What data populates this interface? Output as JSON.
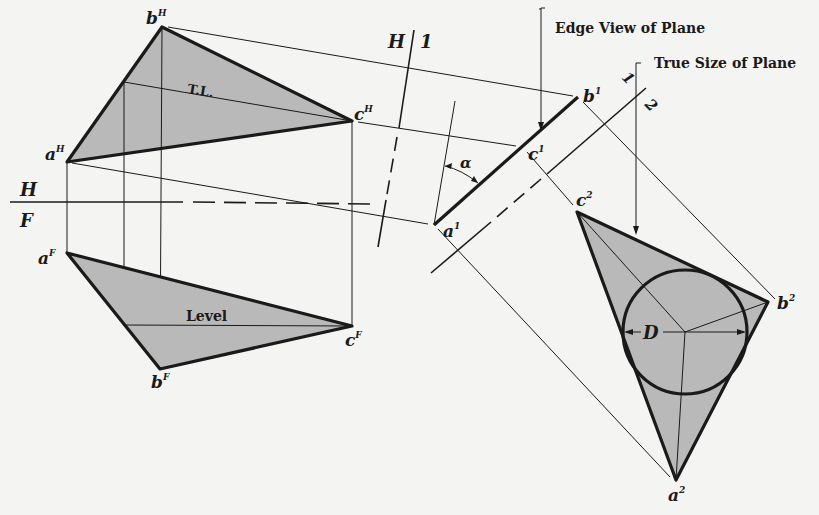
{
  "figure": {
    "colors": {
      "background": "#f4f4f2",
      "ink": "#1a1a1a",
      "plane_fill": "#b9b9b9"
    }
  },
  "fold_lines": {
    "hf": {
      "upper_label": "H",
      "lower_label": "F"
    },
    "h1": {
      "left_label": "H",
      "right_label": "1"
    },
    "one_two": {
      "upper_label": "1",
      "lower_label": "2"
    }
  },
  "top_view": {
    "points": {
      "a": {
        "name": "a",
        "sup": "H",
        "x": 67,
        "y": 162
      },
      "b": {
        "name": "b",
        "sup": "H",
        "x": 162,
        "y": 27
      },
      "c": {
        "name": "c",
        "sup": "H",
        "x": 352,
        "y": 121
      }
    },
    "line_label": "T.L."
  },
  "front_view": {
    "points": {
      "a": {
        "name": "a",
        "sup": "F",
        "x": 67,
        "y": 253
      },
      "b": {
        "name": "b",
        "sup": "F",
        "x": 160,
        "y": 369
      },
      "c": {
        "name": "c",
        "sup": "F",
        "x": 352,
        "y": 326
      }
    },
    "line_label": "Level"
  },
  "aux_view_1": {
    "points": {
      "a": {
        "name": "a",
        "sup": "1",
        "x": 434,
        "y": 225
      },
      "b": {
        "name": "b",
        "sup": "1",
        "x": 578,
        "y": 97
      },
      "c": {
        "name": "c",
        "sup": "1",
        "x": 522,
        "y": 147
      }
    },
    "angle_label": "α",
    "callout": "Edge View of Plane"
  },
  "aux_view_2": {
    "points": {
      "a": {
        "name": "a",
        "sup": "2",
        "x": 676,
        "y": 480
      },
      "b": {
        "name": "b",
        "sup": "2",
        "x": 768,
        "y": 302
      },
      "c": {
        "name": "c",
        "sup": "2",
        "x": 577,
        "y": 212
      }
    },
    "inscribed_circle": {
      "cx": 685,
      "cy": 332,
      "r": 62
    },
    "diameter_label": "D",
    "callout": "True Size of Plane"
  }
}
